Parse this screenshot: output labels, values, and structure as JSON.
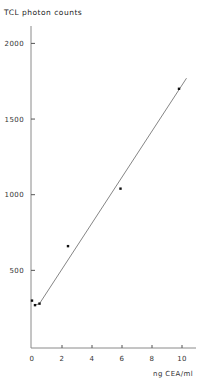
{
  "chart_data": {
    "type": "scatter",
    "title": "",
    "ylabel": "TCL photon counts",
    "xlabel": "ng CEA/ml",
    "xlim": [
      0,
      11
    ],
    "ylim": [
      0,
      2200
    ],
    "x_ticks": [
      0,
      2,
      4,
      6,
      8,
      10
    ],
    "x_tick_labels": [
      "0",
      "2",
      "4",
      "6",
      "8",
      "10"
    ],
    "y_ticks": [
      500,
      1000,
      1500,
      2000
    ],
    "y_tick_labels": [
      "500",
      "1000",
      "1500",
      "2000"
    ],
    "grid": false,
    "legend": null,
    "series": [
      {
        "name": "measured",
        "kind": "points",
        "x": [
          0,
          0.2,
          0.5,
          2.4,
          5.9,
          9.8
        ],
        "y": [
          300,
          270,
          280,
          660,
          1040,
          1700
        ]
      },
      {
        "name": "linear fit",
        "kind": "line",
        "x": [
          0.5,
          10.3
        ],
        "y": [
          280,
          1770
        ]
      }
    ]
  }
}
